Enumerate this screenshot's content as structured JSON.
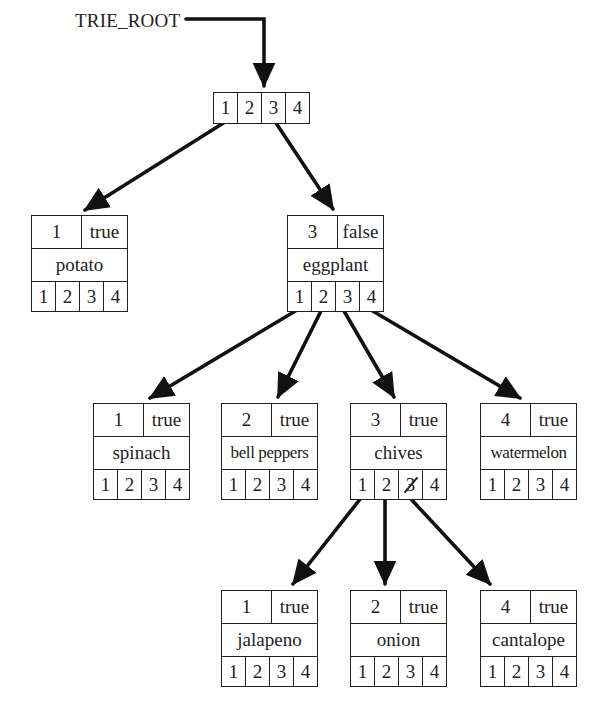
{
  "diagram": {
    "type": "trie",
    "root_label": "TRIE_ROOT",
    "root_pointers": [
      "1",
      "2",
      "3",
      "4"
    ],
    "nodes": {
      "potato": {
        "key": "1",
        "flag": "true",
        "word": "potato",
        "pointers": [
          "1",
          "2",
          "3",
          "4"
        ]
      },
      "eggplant": {
        "key": "3",
        "flag": "false",
        "word": "eggplant",
        "pointers": [
          "1",
          "2",
          "3",
          "4"
        ]
      },
      "spinach": {
        "key": "1",
        "flag": "true",
        "word": "spinach",
        "pointers": [
          "1",
          "2",
          "3",
          "4"
        ]
      },
      "bell_peppers": {
        "key": "2",
        "flag": "true",
        "word": "bell peppers",
        "pointers": [
          "1",
          "2",
          "3",
          "4"
        ]
      },
      "chives": {
        "key": "3",
        "flag": "true",
        "word": "chives",
        "pointers": [
          "1",
          "2",
          "3",
          "4"
        ],
        "struck_pointer": "3"
      },
      "watermelon": {
        "key": "4",
        "flag": "true",
        "word": "watermelon",
        "pointers": [
          "1",
          "2",
          "3",
          "4"
        ]
      },
      "jalapeno": {
        "key": "1",
        "flag": "true",
        "word": "jalapeno",
        "pointers": [
          "1",
          "2",
          "3",
          "4"
        ]
      },
      "onion": {
        "key": "2",
        "flag": "true",
        "word": "onion",
        "pointers": [
          "1",
          "2",
          "3",
          "4"
        ]
      },
      "cantalope": {
        "key": "4",
        "flag": "true",
        "word": "cantalope",
        "pointers": [
          "1",
          "2",
          "3",
          "4"
        ]
      }
    },
    "edges": [
      {
        "from": "TRIE_ROOT",
        "to": "root"
      },
      {
        "from": "root",
        "pointer": "1",
        "to": "potato"
      },
      {
        "from": "root",
        "pointer": "3",
        "to": "eggplant"
      },
      {
        "from": "eggplant",
        "pointer": "1",
        "to": "spinach"
      },
      {
        "from": "eggplant",
        "pointer": "2",
        "to": "bell_peppers"
      },
      {
        "from": "eggplant",
        "pointer": "3",
        "to": "chives"
      },
      {
        "from": "eggplant",
        "pointer": "4",
        "to": "watermelon"
      },
      {
        "from": "chives",
        "pointer": "1",
        "to": "jalapeno"
      },
      {
        "from": "chives",
        "pointer": "2",
        "to": "onion"
      },
      {
        "from": "chives",
        "pointer": "3",
        "to": "cantalope"
      }
    ]
  }
}
